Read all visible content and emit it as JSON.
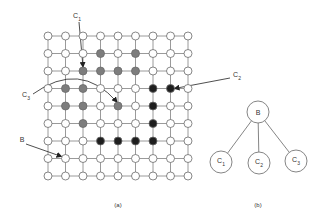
{
  "figure": {
    "panel_a": {
      "caption": "(a)",
      "grid": {
        "rows": 9,
        "cols": 9,
        "origin_x": 48,
        "origin_y": 36,
        "spacing_x": 17.5,
        "spacing_y": 17.5,
        "node_radius": 4,
        "gray_nodes": [
          [
            1,
            3
          ],
          [
            1,
            5
          ],
          [
            2,
            2
          ],
          [
            2,
            3
          ],
          [
            2,
            4
          ],
          [
            2,
            5
          ],
          [
            3,
            1
          ],
          [
            3,
            2
          ],
          [
            4,
            1
          ],
          [
            4,
            2
          ],
          [
            4,
            4
          ],
          [
            5,
            2
          ]
        ],
        "dark_nodes": [
          [
            3,
            6
          ],
          [
            3,
            7
          ],
          [
            4,
            6
          ],
          [
            5,
            6
          ],
          [
            6,
            3
          ],
          [
            6,
            4
          ],
          [
            6,
            5
          ],
          [
            6,
            6
          ]
        ]
      },
      "annotations": [
        {
          "label": "C",
          "sub": "1",
          "x": 77,
          "y": 17,
          "target": [
            2,
            2
          ]
        },
        {
          "label": "C",
          "sub": "2",
          "x": 237,
          "y": 76,
          "target": [
            3,
            7
          ]
        },
        {
          "label": "C",
          "sub": "3",
          "x": 26,
          "y": 96,
          "target": [
            4,
            4
          ]
        },
        {
          "label": "B",
          "sub": "",
          "x": 22,
          "y": 139,
          "target": [
            7,
            1
          ]
        }
      ]
    },
    "panel_b": {
      "caption": "(b)",
      "root": {
        "label": "B",
        "x": 258,
        "y": 112
      },
      "children": [
        {
          "label": "C",
          "sub": "1",
          "x": 221,
          "y": 162
        },
        {
          "label": "C",
          "sub": "2",
          "x": 259,
          "y": 163
        },
        {
          "label": "C",
          "sub": "3",
          "x": 296,
          "y": 161
        }
      ],
      "node_radius": 11
    },
    "colors": {
      "line": "#9a9a9a",
      "node_fill_white": "#ffffff",
      "node_fill_gray": "#7d7d7d",
      "node_fill_dark": "#1e1e1e",
      "text": "#333333"
    }
  }
}
